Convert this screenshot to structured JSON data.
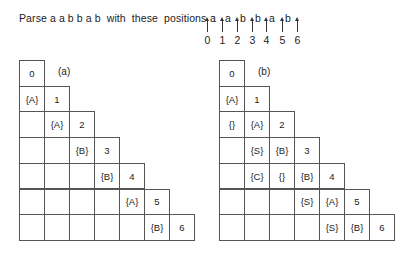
{
  "caption": "Parse a a b b a b  with  these  positions  :",
  "positions": {
    "arrows_x": [
      207,
      222,
      237,
      252,
      266,
      282,
      297
    ],
    "numbers": [
      "0",
      "1",
      "2",
      "3",
      "4",
      "5",
      "6"
    ],
    "letters": [
      {
        "char": "a",
        "x": 210
      },
      {
        "char": "a",
        "x": 225
      },
      {
        "char": "b",
        "x": 240
      },
      {
        "char": "b",
        "x": 255
      },
      {
        "char": "a",
        "x": 269
      },
      {
        "char": "b",
        "x": 285
      }
    ]
  },
  "charts": [
    {
      "id": "a",
      "label": "(a)",
      "left": 19,
      "diagonal": [
        "0",
        "1",
        "2",
        "3",
        "4",
        "5",
        "6"
      ],
      "rows": [
        [
          "0"
        ],
        [
          "{A}",
          "1"
        ],
        [
          "",
          "{A}",
          "2"
        ],
        [
          "",
          "",
          "{B}",
          "3"
        ],
        [
          "",
          "",
          "",
          "{B}",
          "4"
        ],
        [
          "",
          "",
          "",
          "",
          "{A}",
          "5"
        ],
        [
          "",
          "",
          "",
          "",
          "",
          "{B}",
          "6"
        ]
      ]
    },
    {
      "id": "b",
      "label": "(b)",
      "left": 219,
      "diagonal": [
        "0",
        "1",
        "2",
        "3",
        "4",
        "5",
        "6"
      ],
      "rows": [
        [
          "0"
        ],
        [
          "{A}",
          "1"
        ],
        [
          "{}",
          "{A}",
          "2"
        ],
        [
          "",
          "{S}",
          "{B}",
          "3"
        ],
        [
          "",
          "{C}",
          "{}",
          "{B}",
          "4"
        ],
        [
          "",
          "",
          "",
          "{S}",
          "{A}",
          "5"
        ],
        [
          "",
          "",
          "",
          "",
          "{S}",
          "{B}",
          "6"
        ]
      ]
    }
  ]
}
